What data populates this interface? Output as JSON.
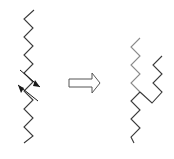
{
  "diagram": {
    "colors": {
      "background": "#ffffff",
      "chain_dark": "#3a3a3a",
      "chain_light": "#8a8a8a",
      "arrow_outline": "#555555",
      "small_arrow": "#1a1a1a"
    },
    "left_chain": {
      "points": "34,10 24,19 33,28 24,37 33,46 24,55 33,64 24,73 33,82 24,91 33,100 24,109 33,118 24,127 33,136 24,143",
      "crossing_arrows": [
        {
          "name": "upper-arrow",
          "line": "20,70 40,87",
          "head": "40,87 35,80 33,86"
        },
        {
          "name": "lower-arrow",
          "line": "38,101 18,85",
          "head": "18,85 24,88 21,93"
        }
      ]
    },
    "transform_arrow": {
      "points": "69,79 92,79 92,73 100,83 92,93 92,87 69,87"
    },
    "right_structure": {
      "upper_light_chain": "140,38 131,47 140,56 131,65 140,74 131,83 140,92",
      "right_branch": "162,56 153,65 162,74 153,83 162,92 152,103 140,92",
      "lower_chain": "140,92 131,101 140,110 131,119 140,128 131,137 134,143"
    }
  }
}
